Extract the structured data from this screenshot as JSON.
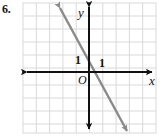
{
  "problem": {
    "number": "6."
  },
  "figure": {
    "kind": "coordinate-grid-line-graph",
    "colors": {
      "grid": "#d9d9d9",
      "axis": "#111111",
      "line": "#8a8a8a",
      "text": "#111111",
      "background": "#ffffff"
    },
    "grid": {
      "left": 23,
      "top": 3,
      "right": 156,
      "bottom": 133,
      "cell_size": 13.3,
      "columns": 10,
      "rows": 10,
      "show_border": true
    },
    "axes": {
      "origin": {
        "x": 89,
        "y": 72
      },
      "unit_px": 13.3,
      "x_axis": {
        "label": "x",
        "label_x": 149,
        "label_y": 85,
        "arrow_left": true,
        "arrow_right": true
      },
      "y_axis": {
        "label": "y",
        "label_x": 78,
        "label_y": 17,
        "arrow_up": true,
        "arrow_down": true
      },
      "origin_label": {
        "text": "O",
        "x": 78,
        "y": 84
      },
      "tick_labels": [
        {
          "text": "1",
          "axis": "y",
          "value": 1,
          "x": 75,
          "y": 64
        },
        {
          "text": "1",
          "axis": "x",
          "value": 1,
          "x": 99,
          "y": 67
        }
      ]
    },
    "plotted_line": {
      "description": "decreasing straight line",
      "slope": -1.8,
      "y_intercept": 0.75,
      "start_px": {
        "x": 60,
        "y": 8
      },
      "end_px": {
        "x": 127,
        "y": 131
      },
      "stroke_width": 2.4,
      "arrow_start": true,
      "arrow_end": true
    }
  }
}
